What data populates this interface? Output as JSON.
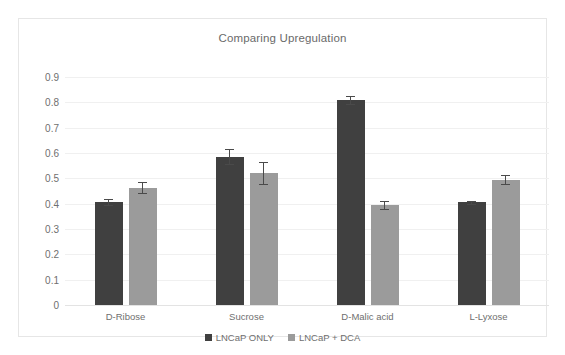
{
  "chart_data": {
    "type": "bar",
    "title": "Comparing Upregulation",
    "xlabel": "",
    "ylabel": "",
    "ylim": [
      0,
      0.9
    ],
    "grid": true,
    "legend_position": "bottom",
    "categories": [
      "D-Ribose",
      "Sucrose",
      "D-Malic acid",
      "L-Lyxose"
    ],
    "yticks": [
      "0.9",
      "0.8",
      "0.7",
      "0.6",
      "0.5",
      "0.4",
      "0.3",
      "0.2",
      "0.1",
      "0"
    ],
    "ytick_values": [
      0.9,
      0.8,
      0.7,
      0.6,
      0.5,
      0.4,
      0.3,
      0.2,
      0.1,
      0
    ],
    "series": [
      {
        "name": "LNCaP ONLY",
        "color": "#404040",
        "values": [
          0.405,
          0.585,
          0.81,
          0.405
        ],
        "errors": [
          0.012,
          0.03,
          0.015,
          0.007
        ]
      },
      {
        "name": "LNCaP + DCA",
        "color": "#9b9b9b",
        "values": [
          0.463,
          0.52,
          0.395,
          0.495
        ],
        "errors": [
          0.022,
          0.043,
          0.017,
          0.017
        ]
      }
    ]
  },
  "legend": {
    "items": [
      {
        "label": "LNCaP ONLY",
        "color": "#404040"
      },
      {
        "label": "LNCaP + DCA",
        "color": "#9b9b9b"
      }
    ]
  }
}
